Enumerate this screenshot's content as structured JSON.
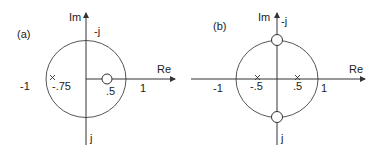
{
  "panels": [
    {
      "id": "a",
      "label": "(a)",
      "axis_labels": {
        "im": "Im",
        "re": "Re"
      },
      "ticks": {
        "neg_one": "-1",
        "one": "1",
        "neg_j": "-j",
        "j": "j"
      },
      "poles": [
        {
          "value": "-.75",
          "label": "-.75"
        }
      ],
      "zeros": [
        {
          "value": ".5",
          "label": ".5"
        }
      ]
    },
    {
      "id": "b",
      "label": "(b)",
      "axis_labels": {
        "im": "Im",
        "re": "Re"
      },
      "ticks": {
        "neg_one": "-1",
        "one": "1",
        "neg_j": "-j",
        "j": "j"
      },
      "poles": [
        {
          "value": "-.5",
          "label": "-.5"
        },
        {
          "value": ".5",
          "label": ".5"
        }
      ],
      "zeros": [
        {
          "value": "-j",
          "label": "top"
        },
        {
          "value": "j",
          "label": "bottom"
        }
      ]
    }
  ],
  "colors": {
    "line": "#333333",
    "circle": "#555555"
  }
}
